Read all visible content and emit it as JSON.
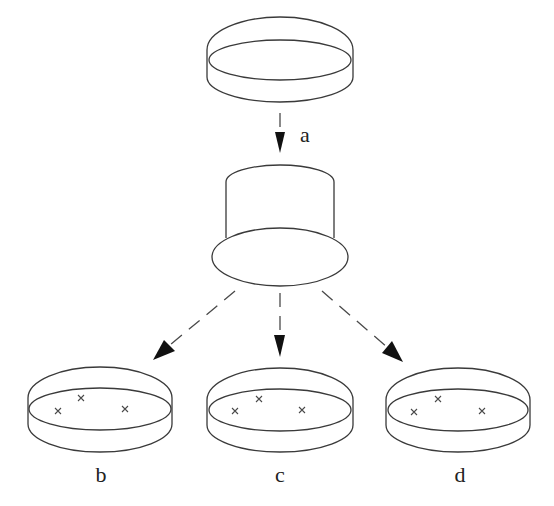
{
  "figure": {
    "steps": {
      "transfer_label": "a"
    },
    "plates": [
      {
        "label": "b",
        "colonies": 3
      },
      {
        "label": "c",
        "colonies": 3
      },
      {
        "label": "d",
        "colonies": 3
      }
    ],
    "colors": {
      "line": "#3a3a3a",
      "arrowhead": "#111111",
      "background": "#ffffff"
    }
  }
}
